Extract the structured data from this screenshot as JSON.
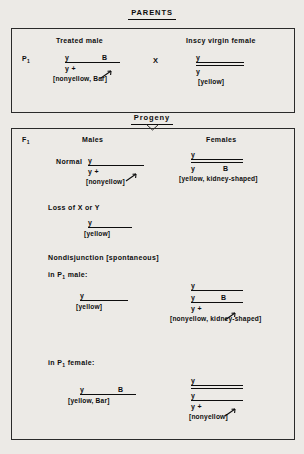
{
  "figure": {
    "type": "genetics-cross-diagram",
    "parents_banner": "PARENTS",
    "progeny_banner": "Progeny"
  },
  "parents": {
    "generation_label": "P",
    "generation_sub": "1",
    "cross_symbol": "X",
    "male": {
      "heading": "Treated male",
      "top_left": "y",
      "top_right": "B",
      "bottom_left": "y +",
      "phenotype": "[nonyellow, Bar]",
      "rule_style": "single",
      "has_arrow": true
    },
    "female": {
      "heading": "Inscy virgin female",
      "top_left": "y",
      "bottom_left": "y",
      "phenotype": "[yellow]",
      "rule_style": "double",
      "has_arrow": false
    }
  },
  "progeny": {
    "generation_label": "F",
    "generation_sub": "1",
    "col_males": "Males",
    "col_females": "Females",
    "sections": [
      {
        "title": "Normal",
        "title_kind": "plain",
        "male": {
          "top_left": "y",
          "top_right": "",
          "mid_left": "y +",
          "mid_right": "",
          "phenotype": "[nonyellow]",
          "rule_style": "single",
          "has_arrow": true
        },
        "female": {
          "top_left": "y",
          "top_right": "",
          "mid_left": "y",
          "mid_right": "B",
          "phenotype": "[yellow, kidney-shaped]",
          "rule_style": "double",
          "has_arrow": false
        }
      },
      {
        "title": "Loss of X or Y",
        "title_kind": "plain",
        "male": {
          "top_left": "y",
          "top_right": "",
          "mid_left": "",
          "mid_right": "",
          "phenotype": "[yellow]",
          "rule_style": "single",
          "has_arrow": false
        },
        "female": null
      },
      {
        "title": "Nondisjunction [spontaneous]",
        "title_kind": "plain",
        "subtitle_pre": "in P",
        "subtitle_sub": "1",
        "subtitle_post": " male:",
        "male": {
          "top_left": "y",
          "top_right": "",
          "mid_left": "",
          "mid_right": "",
          "phenotype": "[yellow]",
          "rule_style": "single",
          "has_arrow": false
        },
        "female": {
          "top_left": "y",
          "top_right": "",
          "mid_left": "y",
          "mid_right": "B",
          "bot_left": "y +",
          "bot_right": "",
          "phenotype": "[nonyellow, kidney-shaped]",
          "rule_style": "triple-single",
          "has_arrow": true
        }
      },
      {
        "title": "",
        "subtitle_pre": "in P",
        "subtitle_sub": "1",
        "subtitle_post": " female:",
        "male": {
          "top_left": "y",
          "top_right": "B",
          "mid_left": "",
          "mid_right": "",
          "phenotype": "[yellow, Bar]",
          "rule_style": "single",
          "has_arrow": false
        },
        "female": {
          "top_left": "y",
          "top_right": "",
          "mid_left": "y",
          "mid_right": "",
          "bot_left": "y +",
          "bot_right": "",
          "phenotype": "[nonyellow]",
          "rule_style": "triple-double",
          "has_arrow": true
        }
      }
    ]
  }
}
